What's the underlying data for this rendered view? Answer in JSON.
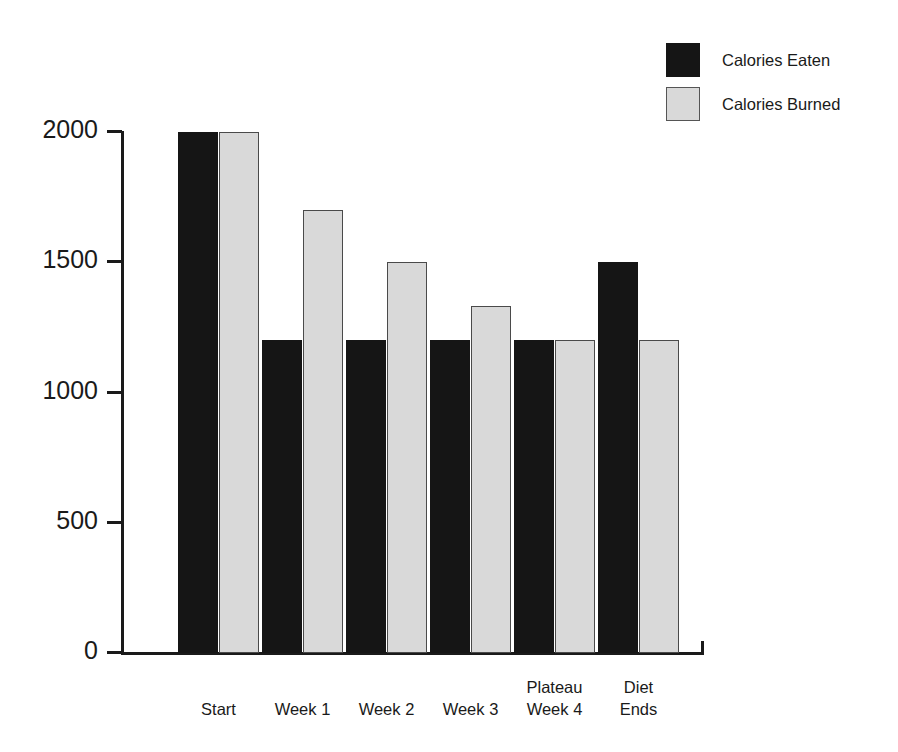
{
  "chart_data": {
    "type": "bar",
    "title": "",
    "subtitle": "",
    "xlabel": "",
    "ylabel": "",
    "categories": [
      "Start",
      "Week 1",
      "Week 2",
      "Week 3",
      "Plateau\nWeek 4",
      "Diet\nEnds"
    ],
    "series": [
      {
        "name": "Calories Eaten",
        "color": "#151515",
        "values": [
          2000,
          1200,
          1200,
          1200,
          1200,
          1500
        ]
      },
      {
        "name": "Calories Burned",
        "color": "#d9d9d9",
        "values": [
          2000,
          1700,
          1500,
          1333,
          1200,
          1200
        ]
      }
    ],
    "yticks": [
      0,
      500,
      1000,
      1500,
      2000
    ],
    "ytick_labels": [
      "0",
      "500",
      "1000",
      "1500",
      "2000"
    ],
    "ylim": [
      0,
      2000
    ],
    "grid": false,
    "legend_position": "top-right",
    "orientation": "vertical",
    "grouping": "grouped"
  },
  "legend": {
    "items": [
      {
        "label": "Calories Eaten",
        "swatch": "black-filled-square"
      },
      {
        "label": "Calories Burned",
        "swatch": "light-gray-outlined-square"
      }
    ]
  },
  "axes": {
    "y_tick_labels": [
      "2000",
      "1500",
      "1000",
      "500",
      "0"
    ],
    "x_category_labels": [
      "Start",
      "Week 1",
      "Week 2",
      "Week 3",
      "Plateau\nWeek 4",
      "Diet\nEnds"
    ]
  },
  "colors": {
    "eaten": "#151515",
    "burned": "#d9d9d9",
    "burned_border": "#4a4a4a",
    "axis": "#1a1a1a",
    "background": "#ffffff"
  }
}
